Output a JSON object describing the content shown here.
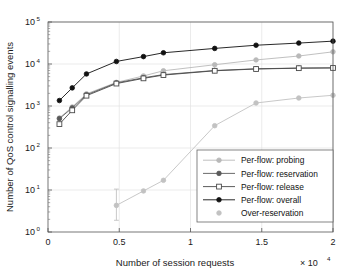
{
  "chart_data": {
    "type": "line",
    "title": "",
    "xlabel": "Number of session requests",
    "ylabel": "Number of QoS control signalling events",
    "x_multiplier": "× 10",
    "x_multiplier_exp": "4",
    "xlim": [
      0,
      20000
    ],
    "ylim": [
      1,
      100000
    ],
    "yscale": "log",
    "xscale": "linear",
    "grid": true,
    "legend_position": "lower right",
    "x_ticks": [
      {
        "value": 0,
        "label": "0"
      },
      {
        "value": 5000,
        "label": "0.5"
      },
      {
        "value": 10000,
        "label": "1"
      },
      {
        "value": 15000,
        "label": "1.5"
      },
      {
        "value": 20000,
        "label": "2"
      }
    ],
    "y_ticks": [
      {
        "value": 1,
        "base": "10",
        "exp": "0"
      },
      {
        "value": 10,
        "base": "10",
        "exp": "1"
      },
      {
        "value": 100,
        "base": "10",
        "exp": "2"
      },
      {
        "value": 1000,
        "base": "10",
        "exp": "3"
      },
      {
        "value": 10000,
        "base": "10",
        "exp": "4"
      },
      {
        "value": 100000,
        "base": "10",
        "exp": "5"
      }
    ],
    "x": [
      800,
      1700,
      2700,
      4800,
      6700,
      8100,
      11700,
      14600,
      17600,
      20000
    ],
    "series": [
      {
        "name": "Per-flow: probing",
        "color": "#b9b9b9",
        "marker": "dot",
        "marker_filled": true,
        "line": true,
        "values": [
          520,
          950,
          1950,
          3650,
          5200,
          6900,
          9600,
          12500,
          15500,
          19500
        ]
      },
      {
        "name": "Per-flow: reservation",
        "color": "#5a5a5a",
        "marker": "dot",
        "marker_filled": true,
        "line": true,
        "values": [
          500,
          900,
          1850,
          3550,
          4700,
          5600,
          7000,
          7700,
          8000,
          8100
        ]
      },
      {
        "name": "Per-flow: release",
        "color": "#4a4a4a",
        "marker": "square",
        "marker_filled": false,
        "line": true,
        "values": [
          370,
          790,
          1760,
          3420,
          4550,
          5450,
          6900,
          7600,
          7950,
          8050
        ]
      },
      {
        "name": "Per-flow: overall",
        "color": "#111111",
        "marker": "dot",
        "marker_filled": true,
        "line": true,
        "values": [
          1350,
          2700,
          5800,
          11500,
          15000,
          18500,
          23500,
          28000,
          31500,
          35000
        ]
      },
      {
        "name": "Over-reservation",
        "color": "#c2c2c2",
        "marker": "dot",
        "marker_filled": true,
        "line": true,
        "values": [
          null,
          null,
          null,
          4.3,
          9.5,
          17,
          340,
          1180,
          1550,
          1800
        ]
      }
    ],
    "error_bars": [
      {
        "series": "Over-reservation",
        "x": 4800,
        "value": 4.3,
        "low": 1.9,
        "high": 10.5
      }
    ],
    "legend_entries": [
      "Per-flow: probing",
      "Per-flow: reservation",
      "Per-flow: release",
      "Per-flow: overall",
      "Over-reservation"
    ]
  }
}
